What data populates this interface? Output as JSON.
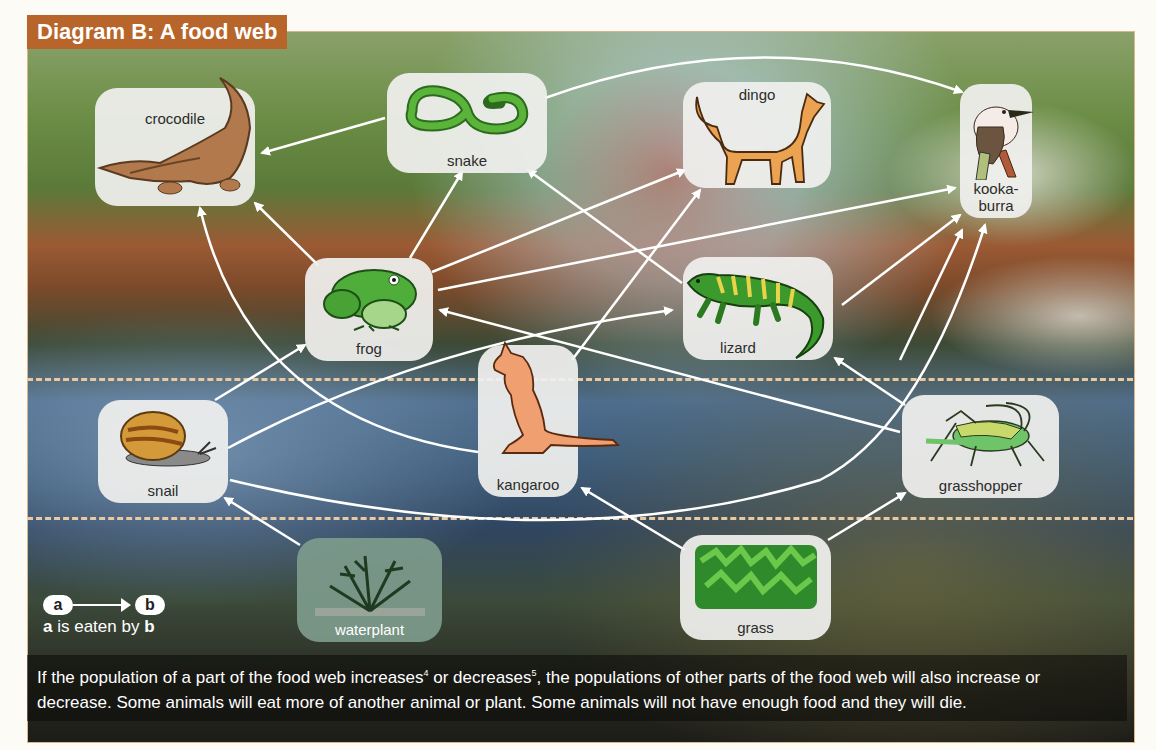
{
  "title": "Diagram B: A food web",
  "legend": {
    "node_a": "a",
    "node_b": "b",
    "caption_a": "a",
    "caption_mid": " is eaten by ",
    "caption_b": "b"
  },
  "nodes": {
    "crocodile": {
      "label": "crocodile",
      "icon": "crocodile"
    },
    "snake": {
      "label": "snake",
      "icon": "snake"
    },
    "dingo": {
      "label": "dingo",
      "icon": "dingo"
    },
    "kookaburra": {
      "label": "kooka-\nburra",
      "label_line1": "kooka-",
      "label_line2": "burra",
      "icon": "kookaburra"
    },
    "frog": {
      "label": "frog",
      "icon": "frog"
    },
    "lizard": {
      "label": "lizard",
      "icon": "lizard"
    },
    "kangaroo": {
      "label": "kangaroo",
      "icon": "kangaroo"
    },
    "snail": {
      "label": "snail",
      "icon": "snail"
    },
    "grasshopper": {
      "label": "grasshopper",
      "icon": "grasshopper"
    },
    "waterplant": {
      "label": "waterplant",
      "icon": "waterplant"
    },
    "grass": {
      "label": "grass",
      "icon": "grass"
    }
  },
  "edges": [
    {
      "from": "snake",
      "to": "crocodile"
    },
    {
      "from": "snake",
      "to": "kookaburra"
    },
    {
      "from": "frog",
      "to": "crocodile"
    },
    {
      "from": "frog",
      "to": "snake"
    },
    {
      "from": "frog",
      "to": "dingo"
    },
    {
      "from": "frog",
      "to": "kookaburra"
    },
    {
      "from": "lizard",
      "to": "snake"
    },
    {
      "from": "lizard",
      "to": "kookaburra"
    },
    {
      "from": "kangaroo",
      "to": "crocodile"
    },
    {
      "from": "kangaroo",
      "to": "dingo"
    },
    {
      "from": "snail",
      "to": "frog"
    },
    {
      "from": "snail",
      "to": "lizard"
    },
    {
      "from": "snail",
      "to": "kookaburra"
    },
    {
      "from": "waterplant",
      "to": "snail"
    },
    {
      "from": "grass",
      "to": "kangaroo"
    },
    {
      "from": "grass",
      "to": "grasshopper"
    },
    {
      "from": "grasshopper",
      "to": "frog"
    },
    {
      "from": "grasshopper",
      "to": "lizard"
    },
    {
      "from": "grasshopper",
      "to": "kookaburra"
    }
  ],
  "body_text": {
    "part1": "If the population of a part of the food web increases",
    "sup1": "4",
    "part2": " or decreases",
    "sup2": "5",
    "part3": ", the populations of other parts of the food web will also increase or decrease. Some animals will eat more of another animal or plant. Some animals will not have enough food and they will die."
  },
  "colors": {
    "title_bg": "#b8652b",
    "frame_border": "#d9b58a",
    "dashed_line": "#e8c9a2",
    "arrow": "#ffffff",
    "node_bg": "#f0f0ee"
  }
}
